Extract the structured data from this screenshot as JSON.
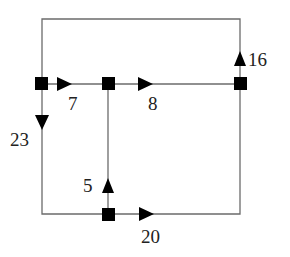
{
  "diagram": {
    "type": "flow-network",
    "colors": {
      "line": "#6b6b6b",
      "node": "#000000",
      "arrow": "#000000",
      "text": "#222222"
    },
    "nodes": [
      {
        "id": "A",
        "x": 42,
        "y": 84
      },
      {
        "id": "B",
        "x": 108,
        "y": 84
      },
      {
        "id": "C",
        "x": 240,
        "y": 84
      },
      {
        "id": "D",
        "x": 108,
        "y": 214
      }
    ],
    "edges": [
      {
        "from": "A",
        "to": "B",
        "direction": "right",
        "label": "7"
      },
      {
        "from": "B",
        "to": "C",
        "direction": "right",
        "label": "8"
      },
      {
        "from": "C",
        "to": "A",
        "direction": "up",
        "via": "top loop",
        "label": "16"
      },
      {
        "from": "A",
        "to": "D",
        "direction": "down",
        "via": "left-bottom loop",
        "label": "23"
      },
      {
        "from": "D",
        "to": "B",
        "direction": "up",
        "label": "5"
      },
      {
        "from": "D",
        "to": "C",
        "direction": "right",
        "via": "bottom-right loop",
        "label": "20"
      }
    ],
    "labels": {
      "ab": "7",
      "bc": "8",
      "ca_top": "16",
      "ad_left": "23",
      "db": "5",
      "dc_bottom": "20"
    }
  }
}
